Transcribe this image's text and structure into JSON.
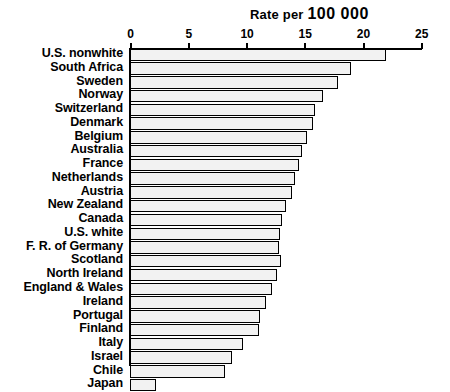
{
  "chart_data": {
    "type": "bar",
    "orientation": "horizontal",
    "title": "Rate per 100 000",
    "title_prefix": "Rate per ",
    "title_emphasis": "100 000",
    "xlabel": "",
    "ylabel": "",
    "xlim": [
      0,
      25
    ],
    "grid": false,
    "legend": null,
    "tick_labels": [
      "0",
      "5",
      "10",
      "15",
      "20",
      "25"
    ],
    "ticks": [
      0,
      5,
      10,
      15,
      20,
      25
    ],
    "categories": [
      "U.S. nonwhite",
      "South Africa",
      "Sweden",
      "Norway",
      "Switzerland",
      "Denmark",
      "Belgium",
      "Australia",
      "France",
      "Netherlands",
      "Austria",
      "New Zealand",
      "Canada",
      "U.S. white",
      "F. R. of Germany",
      "Scotland",
      "North Ireland",
      "England & Wales",
      "Ireland",
      "Portugal",
      "Finland",
      "Italy",
      "Israel",
      "Chile",
      "Japan"
    ],
    "values": [
      22.0,
      19.0,
      17.9,
      16.6,
      15.9,
      15.7,
      15.2,
      14.8,
      14.5,
      14.2,
      13.9,
      13.4,
      13.1,
      12.9,
      12.8,
      13.0,
      12.6,
      12.2,
      11.7,
      11.2,
      11.1,
      9.7,
      8.8,
      8.2,
      2.2
    ],
    "colors": {
      "bar_fill": "#f2f2f2",
      "bar_pattern": "#555555",
      "bar_border": "#000000",
      "axis": "#000000",
      "text": "#000000",
      "background": "#ffffff"
    }
  }
}
